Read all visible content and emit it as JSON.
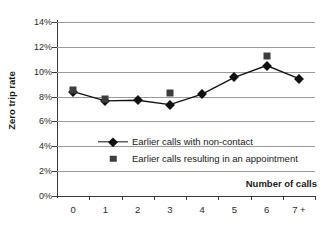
{
  "chart_data": {
    "type": "line",
    "title": "",
    "subtitle": "",
    "xlabel": "Number of calls",
    "ylabel": "Zero trip rate",
    "categories": [
      "0",
      "1",
      "2",
      "3",
      "4",
      "5",
      "6",
      "7 +"
    ],
    "ylim": [
      0,
      14
    ],
    "ytick_labels": [
      "0%",
      "2%",
      "4%",
      "6%",
      "8%",
      "10%",
      "12%",
      "14%"
    ],
    "ytick_values": [
      0,
      2,
      4,
      6,
      8,
      10,
      12,
      14
    ],
    "grid": "horizontal",
    "legend_position": "inside-center-left",
    "series": [
      {
        "name": "Earlier calls with non-contact",
        "marker": "diamond",
        "line": true,
        "color": "#111111",
        "values": [
          8.4,
          7.65,
          7.7,
          7.35,
          8.2,
          9.55,
          10.5,
          9.45
        ]
      },
      {
        "name": "Earlier calls resulting in an appointment",
        "marker": "square",
        "line": false,
        "color": "#3d3d3d",
        "values": [
          8.5,
          7.8,
          null,
          8.3,
          null,
          null,
          11.3,
          null
        ]
      }
    ]
  },
  "legend": {
    "entries": [
      {
        "label": "Earlier calls with non-contact"
      },
      {
        "label": "Earlier calls resulting in an appointment"
      }
    ]
  }
}
